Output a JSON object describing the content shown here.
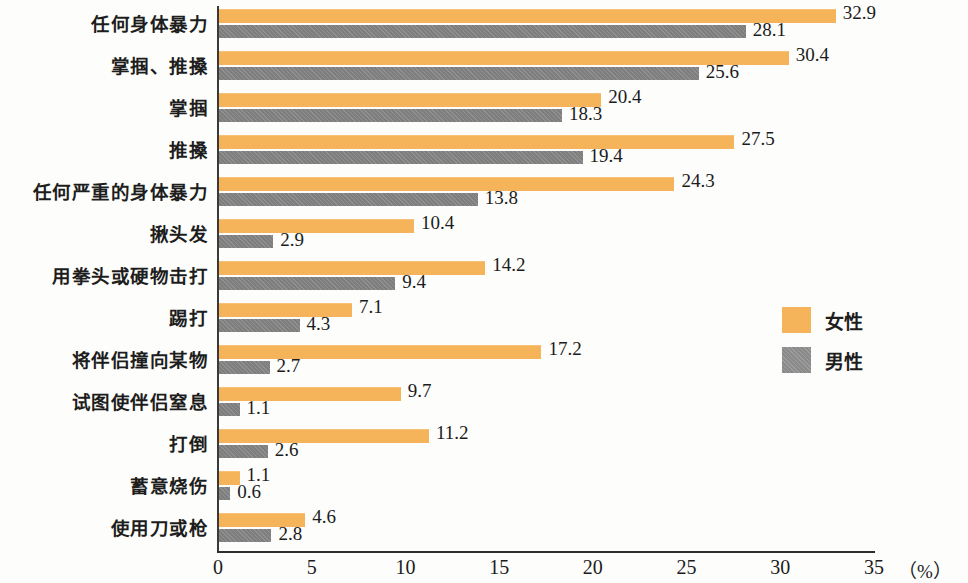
{
  "chart_data": {
    "type": "bar",
    "orientation": "horizontal",
    "title": "",
    "xlabel": "（%）",
    "ylabel": "",
    "xlim": [
      0,
      35
    ],
    "xticks": [
      "0",
      "5",
      "10",
      "15",
      "20",
      "25",
      "30",
      "35"
    ],
    "grid": false,
    "legend_position": "right",
    "categories": [
      "任何身体暴力",
      "掌掴、推搡",
      "掌掴",
      "推搡",
      "任何严重的身体暴力",
      "揪头发",
      "用拳头或硬物击打",
      "踢打",
      "将伴侣撞向某物",
      "试图使伴侣窒息",
      "打倒",
      "蓄意烧伤",
      "使用刀或枪"
    ],
    "series": [
      {
        "name": "女性",
        "color": "#f5b45a",
        "values": [
          32.9,
          30.4,
          20.4,
          27.5,
          24.3,
          10.4,
          14.2,
          7.1,
          17.2,
          9.7,
          11.2,
          1.1,
          4.6
        ]
      },
      {
        "name": "男性",
        "color": "#7e7e7e",
        "values": [
          28.1,
          25.6,
          18.3,
          19.4,
          13.8,
          2.9,
          9.4,
          4.3,
          2.7,
          1.1,
          2.6,
          0.6,
          2.8
        ]
      }
    ]
  }
}
